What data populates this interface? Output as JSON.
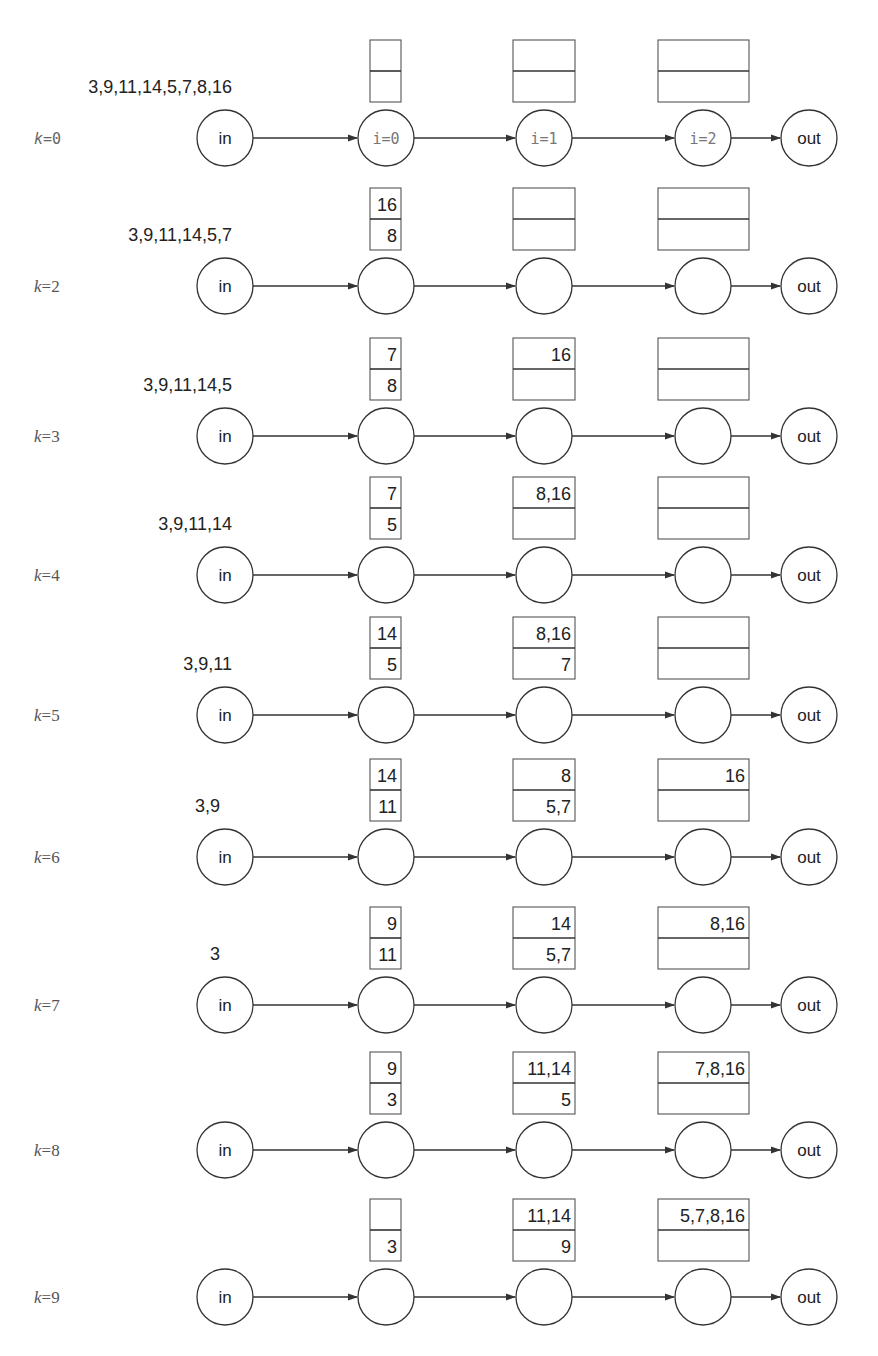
{
  "diagram": {
    "nodes": {
      "input_label": "in",
      "output_label": "out",
      "stage_labels": [
        "i=0",
        "i=1",
        "i=2"
      ]
    },
    "rows": [
      {
        "k_var": "k",
        "k_eq": "=0",
        "k_style": "mono",
        "input": "3,9,11,14,5,7,8,16",
        "buffers": [
          {
            "top": "",
            "bottom": ""
          },
          {
            "top": "",
            "bottom": ""
          },
          {
            "top": "",
            "bottom": ""
          }
        ],
        "show_stage_labels": true
      },
      {
        "k_var": "k",
        "k_eq": "=2",
        "k_style": "serif",
        "input": "3,9,11,14,5,7",
        "buffers": [
          {
            "top": "16",
            "bottom": "8"
          },
          {
            "top": "",
            "bottom": ""
          },
          {
            "top": "",
            "bottom": ""
          }
        ],
        "show_stage_labels": false
      },
      {
        "k_var": "k",
        "k_eq": "=3",
        "k_style": "serif",
        "input": "3,9,11,14,5",
        "buffers": [
          {
            "top": "7",
            "bottom": "8"
          },
          {
            "top": "16",
            "bottom": ""
          },
          {
            "top": "",
            "bottom": ""
          }
        ],
        "show_stage_labels": false
      },
      {
        "k_var": "k",
        "k_eq": "=4",
        "k_style": "serif",
        "input": "3,9,11,14",
        "buffers": [
          {
            "top": "7",
            "bottom": "5"
          },
          {
            "top": "8,16",
            "bottom": ""
          },
          {
            "top": "",
            "bottom": ""
          }
        ],
        "show_stage_labels": false
      },
      {
        "k_var": "k",
        "k_eq": "=5",
        "k_style": "serif",
        "input": "3,9,11",
        "buffers": [
          {
            "top": "14",
            "bottom": "5"
          },
          {
            "top": "8,16",
            "bottom": "7"
          },
          {
            "top": "",
            "bottom": ""
          }
        ],
        "show_stage_labels": false
      },
      {
        "k_var": "k",
        "k_eq": "=6",
        "k_style": "serif",
        "input": "3,9",
        "buffers": [
          {
            "top": "14",
            "bottom": "11"
          },
          {
            "top": "8",
            "bottom": "5,7"
          },
          {
            "top": "16",
            "bottom": ""
          }
        ],
        "show_stage_labels": false
      },
      {
        "k_var": "k",
        "k_eq": "=7",
        "k_style": "serif",
        "input": "3",
        "buffers": [
          {
            "top": "9",
            "bottom": "11"
          },
          {
            "top": "14",
            "bottom": "5,7"
          },
          {
            "top": "8,16",
            "bottom": ""
          }
        ],
        "show_stage_labels": false
      },
      {
        "k_var": "k",
        "k_eq": "=8",
        "k_style": "serif",
        "input": "",
        "buffers": [
          {
            "top": "9",
            "bottom": "3"
          },
          {
            "top": "11,14",
            "bottom": "5"
          },
          {
            "top": "7,8,16",
            "bottom": ""
          }
        ],
        "show_stage_labels": false
      },
      {
        "k_var": "k",
        "k_eq": "=9",
        "k_style": "serif",
        "input": "",
        "buffers": [
          {
            "top": "",
            "bottom": "3"
          },
          {
            "top": "11,14",
            "bottom": "9"
          },
          {
            "top": "5,7,8,16",
            "bottom": ""
          }
        ],
        "show_stage_labels": false
      }
    ]
  }
}
